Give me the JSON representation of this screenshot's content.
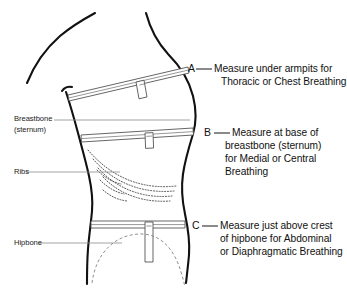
{
  "figure": {
    "background_color": "#ffffff",
    "outline_color": "#111111",
    "tape_color": "#4a4a4a",
    "leader_color": "#8a8a8a"
  },
  "callouts": [
    {
      "letter": "A",
      "lines": [
        "Measure under armpits for",
        "Thoracic or Chest Breathing"
      ]
    },
    {
      "letter": "B",
      "lines": [
        "Measure at base of",
        "breastbone (sternum)",
        "for Medial or Central",
        "Breathing"
      ]
    },
    {
      "letter": "C",
      "lines": [
        "Measure just above crest",
        "of hipbone for Abdominal",
        "or Diaphragmatic Breathing"
      ]
    }
  ],
  "part_labels": [
    {
      "lines": [
        "Breastbone",
        "(sternum)"
      ]
    },
    {
      "lines": [
        "Ribs"
      ]
    },
    {
      "lines": [
        "Hipbone"
      ]
    }
  ]
}
